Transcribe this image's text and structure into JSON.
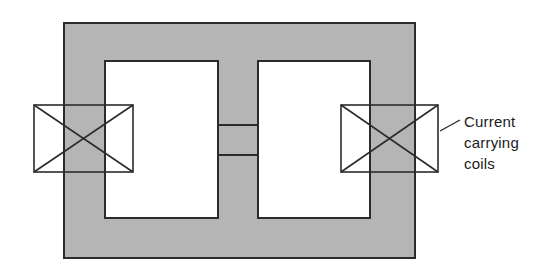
{
  "figure": {
    "background_color": "#ffffff",
    "core_fill_color": "#b5b5b5",
    "line_color": "#2b2b2b",
    "window_fill_color": "#ffffff"
  },
  "core": {
    "name": "magnetic-core",
    "outer_rect": {
      "x": 64,
      "y": 23,
      "width": 351,
      "height": 235
    },
    "left_window": {
      "x": 105,
      "y": 61,
      "width": 113,
      "height": 157
    },
    "right_window": {
      "x": 258,
      "y": 61,
      "width": 112,
      "height": 157
    },
    "center_gap": {
      "x": 218,
      "y": 125,
      "width": 40,
      "height": 30
    },
    "center_post_width": 40
  },
  "coils": [
    {
      "name": "coil-left",
      "label": "left current carrying coil",
      "rect": {
        "x": 34,
        "y": 105,
        "width": 99,
        "height": 67
      },
      "cross_marking": true
    },
    {
      "name": "coil-right",
      "label": "right current carrying coil",
      "rect": {
        "x": 341,
        "y": 105,
        "width": 97,
        "height": 67
      },
      "cross_marking": true
    }
  ],
  "annotation": {
    "name": "coils-annotation",
    "lines": [
      "Current",
      "carrying",
      "coils"
    ],
    "line1": "Current",
    "line2": "carrying",
    "line3": "coils",
    "leader": {
      "x1": 440,
      "y1": 131,
      "x2": 460,
      "y2": 120
    },
    "text_x": 464,
    "line1_y": 127,
    "line2_y": 148,
    "line3_y": 169
  }
}
